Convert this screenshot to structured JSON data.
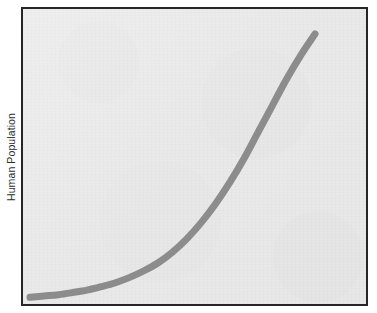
{
  "figure": {
    "width": 377,
    "height": 313,
    "background_color": "#ffffff",
    "plot_background_color": "#e7e7e7",
    "frame_color": "#262626"
  },
  "labels": {
    "y_axis": "Human Population",
    "x_axis": "",
    "title": ""
  },
  "chart_data": {
    "type": "line",
    "title": "",
    "xlabel": "",
    "ylabel": "Human Population",
    "grid": false,
    "legend": null,
    "axis_ticks": false,
    "tick_labels": [],
    "xlim": [
      0,
      100
    ],
    "ylim": [
      0,
      100
    ],
    "series": [
      {
        "name": "Human Population",
        "color": "#8c8c8c",
        "line_width": 7,
        "shape": "exponential growth (J-curve)",
        "x": [
          0,
          5,
          10,
          15,
          20,
          25,
          30,
          35,
          40,
          45,
          50,
          55,
          60,
          65,
          70,
          75,
          80,
          85,
          90,
          95,
          100
        ],
        "y": [
          1,
          1.5,
          2,
          2.8,
          3.7,
          5,
          6.5,
          8.5,
          11,
          14,
          18,
          23,
          29,
          36,
          44,
          53,
          63,
          73,
          83,
          92,
          100
        ]
      }
    ]
  }
}
